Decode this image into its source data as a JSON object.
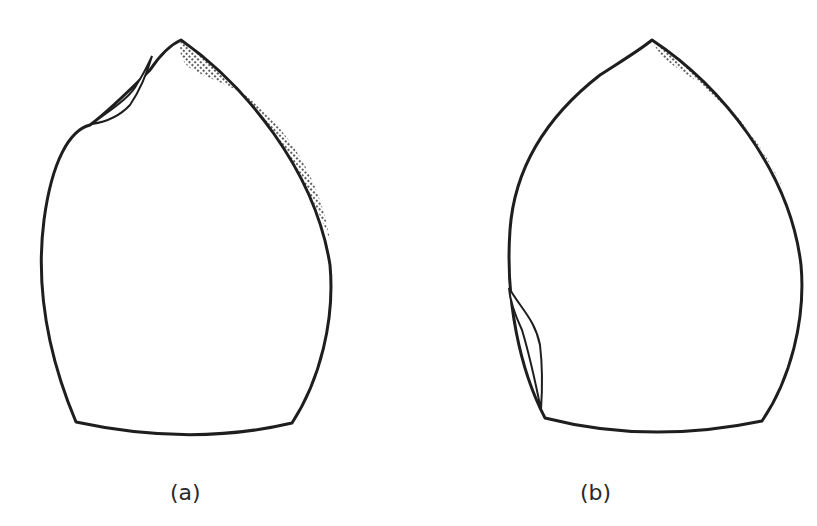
{
  "figure": {
    "panels": [
      {
        "id": "a",
        "label": "(a)",
        "description": "Shape with shaded upper-right rim and a small flap near top-left"
      },
      {
        "id": "b",
        "label": "(b)",
        "description": "Shape with shaded upper-right rim and a flap along lower-left side"
      }
    ],
    "colors": {
      "stroke": "#1e1e1e",
      "shade": "#3a3a3a",
      "background": "#ffffff"
    }
  }
}
